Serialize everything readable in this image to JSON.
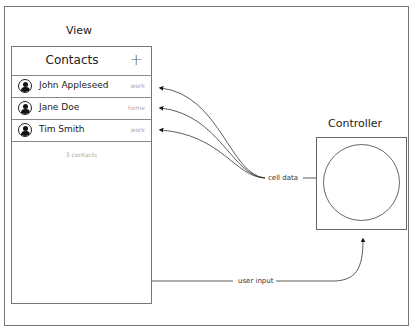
{
  "diagram": {
    "view_label": "View",
    "controller_label": "Controller",
    "cell_data_label": "cell data",
    "user_input_label": "user input"
  },
  "view": {
    "nav_title": "Contacts",
    "add_icon": "+",
    "contacts": [
      {
        "name": "John Appleseed",
        "tag": "work"
      },
      {
        "name": "Jane Doe",
        "tag": "home"
      },
      {
        "name": "Tim Smith",
        "tag": "work"
      }
    ],
    "footer_count": "3 contacts"
  }
}
